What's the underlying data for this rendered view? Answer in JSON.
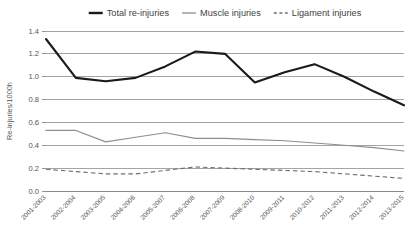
{
  "chart_data": {
    "type": "line",
    "title": "",
    "xlabel": "",
    "ylabel": "Re-injuries/1000h",
    "ylim": [
      0.0,
      1.4
    ],
    "yticks": [
      "0.0",
      "0.2",
      "0.4",
      "0.6",
      "0.8",
      "1.0",
      "1.2",
      "1.4"
    ],
    "ytick_values": [
      0.0,
      0.2,
      0.4,
      0.6,
      0.8,
      1.0,
      1.2,
      1.4
    ],
    "grid": true,
    "legend_position": "top-center",
    "categories": [
      "2001-2003",
      "2002-2004",
      "2003-2005",
      "2004-2006",
      "2005-2007",
      "2006-2008",
      "2007-2009",
      "2008-2010",
      "2009-2011",
      "2010-2012",
      "2011-2013",
      "2012-2014",
      "2013-2015"
    ],
    "series": [
      {
        "name": "Total re-injuries",
        "color": "#1a1a1a",
        "style": "solid-thick",
        "values": [
          1.33,
          0.99,
          0.96,
          0.99,
          1.09,
          1.22,
          1.2,
          0.95,
          1.04,
          1.11,
          1.0,
          0.87,
          0.75
        ]
      },
      {
        "name": "Muscle injuries",
        "color": "#8e8e8e",
        "style": "solid-thin",
        "values": [
          0.53,
          0.53,
          0.43,
          0.47,
          0.51,
          0.46,
          0.46,
          0.45,
          0.44,
          0.42,
          0.4,
          0.38,
          0.35
        ]
      },
      {
        "name": "Ligament injuries",
        "color": "#6f6f6f",
        "style": "dashed",
        "values": [
          0.19,
          0.17,
          0.15,
          0.15,
          0.18,
          0.21,
          0.2,
          0.19,
          0.18,
          0.17,
          0.15,
          0.13,
          0.11
        ]
      }
    ]
  },
  "legend": {
    "items": [
      {
        "label": "Total re-injuries"
      },
      {
        "label": "Muscle injuries"
      },
      {
        "label": "Ligament injuries"
      }
    ]
  }
}
